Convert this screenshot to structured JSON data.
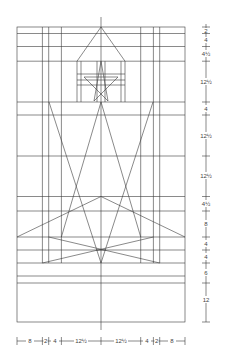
{
  "diagram": {
    "stroke_color": "#3a3a3a",
    "vertical_scale": {
      "labels": [
        "2",
        "4",
        "4½",
        "12½",
        "4",
        "12½",
        "12½",
        "4½",
        "8",
        "4",
        "4",
        "6",
        "12"
      ]
    },
    "horizontal_scale": {
      "labels": [
        "8",
        "2",
        "4",
        "12½",
        "12½",
        "4",
        "2",
        "8"
      ]
    }
  }
}
